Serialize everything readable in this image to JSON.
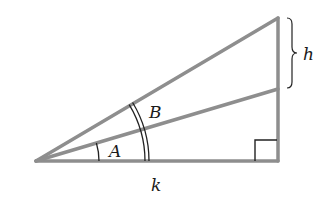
{
  "diagram": {
    "type": "right-triangle-angle-diagram",
    "colors": {
      "triangle_stroke": "#8e8e8e",
      "mark_stroke": "#222222",
      "label_color": "#1a1a1a",
      "background": "#ffffff"
    },
    "vertices": {
      "apex": [
        36,
        161
      ],
      "bottom_right": [
        278,
        161
      ],
      "top_right": [
        278,
        18
      ],
      "mid_right": [
        278,
        89
      ]
    },
    "labels": {
      "angle_a": "A",
      "angle_b": "B",
      "height": "h",
      "base": "k"
    },
    "marks": {
      "angle_a_arc": "single",
      "angle_b_arc": "double",
      "right_angle": "square",
      "height_brace": "curly-brace"
    }
  }
}
